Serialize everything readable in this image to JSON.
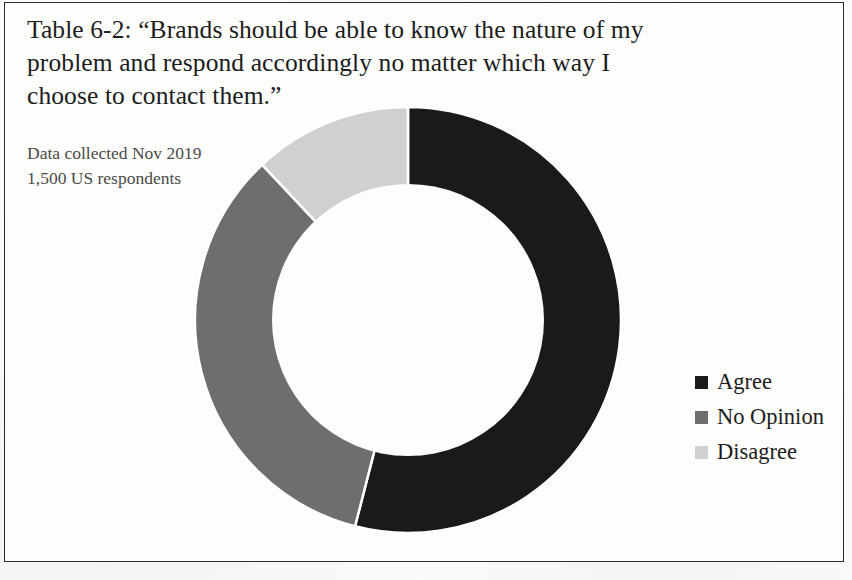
{
  "figure": {
    "caption": "Table 6-2: “Brands should be able to know the nature of my problem and respond accordingly no matter which way I choose to contact them.”",
    "note_line_1": "Data collected Nov 2019",
    "note_line_2": "1,500 US respondents"
  },
  "legend": {
    "items": [
      {
        "label": "Agree",
        "color": "#1a1a1a"
      },
      {
        "label": "No Opinion",
        "color": "#6e6e6e"
      },
      {
        "label": "Disagree",
        "color": "#d0d0d0"
      }
    ]
  },
  "chart_data": {
    "type": "pie",
    "variant": "donut",
    "title": "Table 6-2: “Brands should be able to know the nature of my problem and respond accordingly no matter which way I choose to contact them.”",
    "subtitle": "Data collected Nov 2019 — 1,500 US respondents",
    "categories": [
      "Agree",
      "No Opinion",
      "Disagree"
    ],
    "values": [
      54,
      34,
      12
    ],
    "value_unit": "percent",
    "colors": [
      "#1a1a1a",
      "#6e6e6e",
      "#d0d0d0"
    ],
    "start_angle_deg": 0,
    "direction": "clockwise",
    "hole_ratio": 0.64,
    "legend_position": "right",
    "data_labels_shown": false,
    "grid": false,
    "sample_size": 1500,
    "collection_date": "Nov 2019",
    "segment_boundaries_deg": [
      0,
      196,
      317,
      360
    ],
    "slice_separator_color": "#ffffff"
  }
}
